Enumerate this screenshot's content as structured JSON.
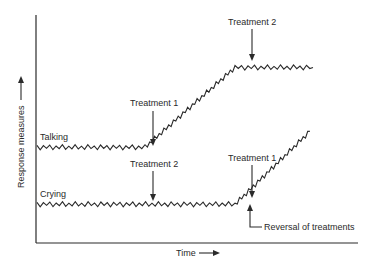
{
  "chart_data": {
    "type": "line",
    "title": "",
    "xlabel": "Time",
    "ylabel": "Response measures",
    "axis_arrows": true,
    "grid": false,
    "legend": "none (series labelled inline)",
    "note": "Schematic: no tick marks or numeric scale. Values are relative levels read off the drawn line positions, on a 0-100 scale (0 = x-axis, 100 = top of y-axis).",
    "x_range": [
      0,
      100
    ],
    "y_range": [
      0,
      100
    ],
    "series": [
      {
        "name": "Talking",
        "label": "Talking",
        "style": "zigzag",
        "points": [
          [
            0,
            42
          ],
          [
            36,
            42
          ],
          [
            66,
            77
          ],
          [
            92,
            77
          ]
        ]
      },
      {
        "name": "Crying",
        "label": "Crying",
        "style": "zigzag",
        "points": [
          [
            0,
            17
          ],
          [
            66,
            17
          ],
          [
            91,
            49
          ]
        ]
      }
    ],
    "annotations": [
      {
        "text": "Treatment 1",
        "series": "Talking",
        "x": 36,
        "arrow": "down"
      },
      {
        "text": "Treatment 2",
        "series": "Talking",
        "x": 66,
        "arrow": "down"
      },
      {
        "text": "Treatment 2",
        "series": "Crying",
        "x": 36,
        "arrow": "down"
      },
      {
        "text": "Treatment 1",
        "series": "Crying",
        "x": 66,
        "arrow": "down"
      },
      {
        "text": "Reversal of treatments",
        "series": "Crying",
        "x": 66,
        "arrow": "up"
      }
    ]
  },
  "labels": {
    "ylabel": "Response measures",
    "xlabel": "Time",
    "talking": "Talking",
    "crying": "Crying",
    "talking_t1": "Treatment 1",
    "talking_t2": "Treatment 2",
    "crying_t2": "Treatment 2",
    "crying_t1": "Treatment 1",
    "reversal": "Reversal of treatments"
  }
}
